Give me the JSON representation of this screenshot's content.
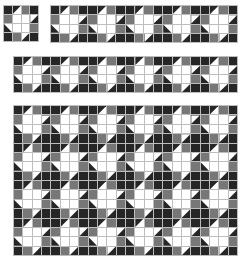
{
  "colors": {
    "dark": "#262626",
    "gray": "#777777",
    "white": "#ffffff",
    "grid_line": "#bdbdbd"
  },
  "block_pattern": [
    [
      "D",
      "T:D-ul:W",
      "G",
      "D"
    ],
    [
      "G",
      "W",
      "W",
      "T:W-ul:D"
    ],
    [
      "T:D-ll:W",
      "W",
      "W",
      "G"
    ],
    [
      "D",
      "G",
      "T:W-ul:D",
      "D"
    ]
  ],
  "panels": [
    {
      "name": "single-block",
      "x": 3,
      "y": 5,
      "w": 36,
      "h": 37,
      "cols": 1,
      "rows": 1
    },
    {
      "name": "strip-five-blocks",
      "x": 50,
      "y": 5,
      "w": 188,
      "h": 38,
      "cols": 5,
      "rows": 1
    },
    {
      "name": "strip-six-blocks",
      "x": 13,
      "y": 56,
      "w": 225,
      "h": 37,
      "cols": 6,
      "rows": 1
    },
    {
      "name": "quilt-grid",
      "x": 13,
      "y": 105,
      "w": 225,
      "h": 151,
      "cols": 6,
      "rows": 4
    }
  ]
}
